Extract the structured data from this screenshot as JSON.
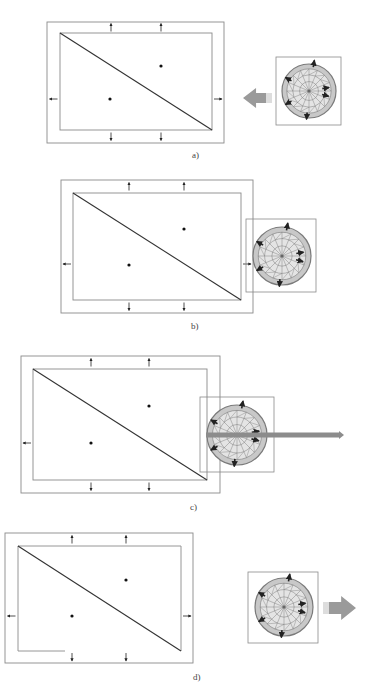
{
  "figure": {
    "type": "sequence-diagram",
    "colors": {
      "frame": "#8a8a8a",
      "diagonal": "#333333",
      "dot": "#111111",
      "circle_fill": "#c8c8c8",
      "circle_line": "#7a7a7a",
      "arrow_block": "#9a9a9a",
      "bar": "#8c8c8c"
    },
    "panels": [
      {
        "id": "a",
        "label": "a)",
        "outer": [
          47,
          22,
          224,
          143
        ],
        "inner": [
          60,
          33,
          212,
          130
        ],
        "dots": [
          [
            110,
            99
          ],
          [
            161,
            66
          ]
        ],
        "boundary_arrows": {
          "top_x": [
            111,
            161
          ],
          "bottom_x": [
            111,
            161
          ],
          "side_y": 99
        },
        "tool": {
          "box": [
            276,
            57,
            341,
            125
          ],
          "center": [
            309,
            91
          ],
          "r": 27
        },
        "motion": {
          "kind": "block-arrow-left",
          "x1": 243,
          "x2": 272,
          "y": 98
        },
        "label_pos": [
          192,
          158
        ]
      },
      {
        "id": "b",
        "label": "b)",
        "outer": [
          61,
          180,
          253,
          313
        ],
        "inner": [
          73,
          193,
          241,
          300
        ],
        "dots": [
          [
            129,
            265
          ],
          [
            184,
            229
          ]
        ],
        "boundary_arrows": {
          "top_x": [
            129,
            184
          ],
          "bottom_x": [
            129,
            184
          ],
          "side_y": 264
        },
        "tool": {
          "box": [
            246,
            219,
            316,
            292
          ],
          "center": [
            282,
            256
          ],
          "r": 29
        },
        "motion": null,
        "label_pos": [
          191,
          329
        ]
      },
      {
        "id": "c",
        "label": "c)",
        "outer": [
          21,
          356,
          220,
          493
        ],
        "inner": [
          33,
          369,
          207,
          480
        ],
        "dots": [
          [
            91,
            443
          ],
          [
            149,
            406
          ]
        ],
        "boundary_arrows": {
          "top_x": [
            91,
            149
          ],
          "bottom_x": [
            91,
            149
          ],
          "side_y": 443
        },
        "tool": {
          "box": [
            200,
            397,
            274,
            472
          ],
          "center": [
            237,
            435
          ],
          "r": 30
        },
        "motion": {
          "kind": "long-bar-right",
          "x1": 206,
          "x2": 344,
          "y": 435
        },
        "label_pos": [
          190,
          510
        ]
      },
      {
        "id": "d",
        "label": "d)",
        "outer": [
          5,
          533,
          193,
          663
        ],
        "inner": [
          18,
          546,
          181,
          651
        ],
        "inner_bottom_gap": [
          65,
          181
        ],
        "dots": [
          [
            72,
            616
          ],
          [
            126,
            580
          ]
        ],
        "boundary_arrows": {
          "top_x": [
            72,
            126
          ],
          "bottom_x": [
            72,
            126
          ],
          "side_y": 616
        },
        "tool": {
          "box": [
            248,
            572,
            318,
            643
          ],
          "center": [
            284,
            607
          ],
          "r": 29
        },
        "motion": {
          "kind": "block-arrow-right",
          "x1": 323,
          "x2": 356,
          "y": 608
        },
        "label_pos": [
          193,
          680
        ]
      }
    ]
  }
}
